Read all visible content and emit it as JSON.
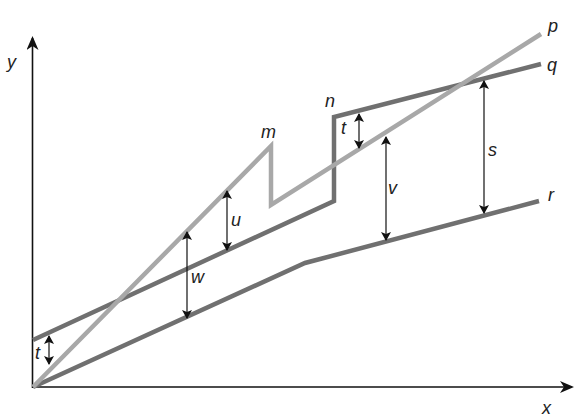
{
  "diagram": {
    "axes": {
      "x_label": "x",
      "y_label": "y"
    },
    "colors": {
      "p": "#a8a8a8",
      "q": "#707070",
      "r": "#707070",
      "axis": "#111111",
      "arrow": "#111111"
    },
    "lines": [
      {
        "name": "p",
        "label": "p",
        "description": "light gray line from origin rising to m, dropping vertically, then rising to end"
      },
      {
        "name": "q",
        "label": "q",
        "description": "dark gray line starting above origin by t, rising to n, stepping up vertically, then rising less steeply"
      },
      {
        "name": "r",
        "label": "r",
        "description": "dark gray line from origin rising with a bend, lowest line"
      }
    ],
    "points": {
      "m": "m",
      "n": "n"
    },
    "measurements": [
      {
        "name": "t_left",
        "label": "t",
        "between": "q and origin/p at y-axis"
      },
      {
        "name": "t_right",
        "label": "t",
        "between": "q and p just after n"
      },
      {
        "name": "u",
        "label": "u",
        "between": "p and q"
      },
      {
        "name": "w",
        "label": "w",
        "between": "p and r"
      },
      {
        "name": "v",
        "label": "v",
        "between": "p and r"
      },
      {
        "name": "s",
        "label": "s",
        "between": "q and r"
      }
    ]
  }
}
